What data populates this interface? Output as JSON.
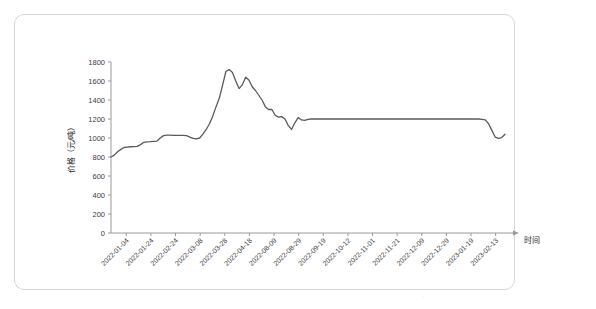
{
  "figure": {
    "background_color": "#ffffff",
    "frame_color": "#d6d6d6",
    "line_color": "#5a5a5a",
    "axis_color": "#9a9a9a",
    "text_color": "#3c3c3c"
  },
  "chart_data": {
    "type": "line",
    "title": "",
    "subtitle": "",
    "xlabel": "时间",
    "ylabel": "价格（元/吨）",
    "ylim": [
      0,
      1800
    ],
    "ytick_step": 200,
    "yticks": [
      0,
      200,
      400,
      600,
      800,
      1000,
      1200,
      1400,
      1600,
      1800
    ],
    "ytick_labels": [
      "0",
      "200",
      "400",
      "600",
      "800",
      "1000",
      "1200",
      "1400",
      "1600",
      "1800"
    ],
    "grid": false,
    "legend": null,
    "legend_position": "none",
    "xticks": [
      "2022-01-04",
      "2022-01-24",
      "2022-02-24",
      "2022-03-08",
      "2022-03-28",
      "2022-04-18",
      "2022-08-09",
      "2022-08-29",
      "2022-09-19",
      "2022-10-12",
      "2022-11-01",
      "2022-11-21",
      "2022-12-09",
      "2022-12-29",
      "2023-01-19",
      "2023-02-13"
    ],
    "xtick_rotation_deg": -45,
    "series": [
      {
        "name": "价格",
        "color": "#5a5a5a",
        "values": [
          800,
          820,
          855,
          880,
          900,
          905,
          908,
          910,
          912,
          930,
          955,
          960,
          962,
          965,
          968,
          1000,
          1025,
          1030,
          1030,
          1028,
          1028,
          1028,
          1028,
          1025,
          1010,
          995,
          992,
          1000,
          1040,
          1090,
          1150,
          1230,
          1330,
          1420,
          1560,
          1700,
          1720,
          1690,
          1600,
          1520,
          1560,
          1640,
          1610,
          1540,
          1500,
          1450,
          1400,
          1330,
          1300,
          1300,
          1240,
          1220,
          1225,
          1200,
          1130,
          1090,
          1160,
          1215,
          1190,
          1185,
          1195,
          1200,
          1200,
          1200,
          1200,
          1200,
          1200,
          1200,
          1200,
          1200,
          1200,
          1200,
          1200,
          1200,
          1200,
          1200,
          1200,
          1200,
          1200,
          1200,
          1200,
          1200,
          1200,
          1200,
          1200,
          1200,
          1200,
          1200,
          1200,
          1200,
          1200,
          1200,
          1200,
          1200,
          1200,
          1200,
          1200,
          1200,
          1200,
          1200,
          1200,
          1200,
          1200,
          1200,
          1200,
          1200,
          1200,
          1200,
          1200,
          1200,
          1200,
          1200,
          1200,
          1195,
          1190,
          1150,
          1080,
          1010,
          995,
          1005,
          1040
        ]
      }
    ]
  }
}
